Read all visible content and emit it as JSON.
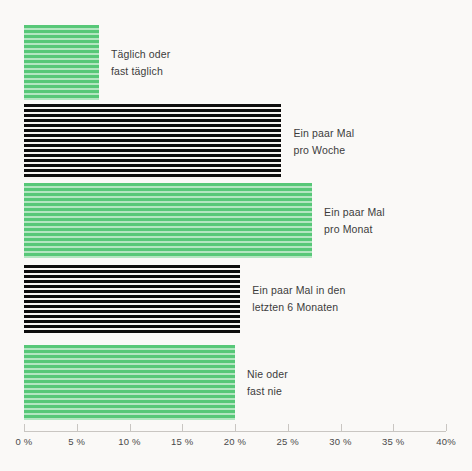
{
  "chart_data": {
    "type": "bar",
    "orientation": "horizontal",
    "title": "",
    "subtitle": "",
    "xlabel": "",
    "ylabel": "",
    "xlim": [
      0,
      40
    ],
    "grid": false,
    "legend": "none",
    "value_suffix": "%",
    "categories": [
      "Täglich oder fast täglich",
      "Ein paar Mal pro Woche",
      "Ein paar Mal pro Monat",
      "Ein paar Mal in den letzten 6 Monaten",
      "Nie oder fast nie"
    ],
    "values": [
      7.1,
      24.4,
      27.3,
      20.5,
      20.0
    ],
    "tick_labels": [
      "0 %",
      "5 %",
      "10 %",
      "15 %",
      "20 %",
      "25 %",
      "30 %",
      "35 %",
      "40%"
    ],
    "tick_values": [
      0,
      5,
      10,
      15,
      20,
      25,
      30,
      35,
      40
    ],
    "bars": [
      {
        "label_line1": "Täglich oder",
        "label_line2": "fast täglich",
        "value": 7.1,
        "color": "#57c878",
        "style": "green-striped"
      },
      {
        "label_line1": "Ein paar Mal",
        "label_line2": "pro Woche",
        "value": 24.4,
        "color": "#0d0d0d",
        "style": "black-striped"
      },
      {
        "label_line1": "Ein paar Mal",
        "label_line2": "pro Monat",
        "value": 27.3,
        "color": "#57c878",
        "style": "green-striped"
      },
      {
        "label_line1": "Ein paar Mal in den",
        "label_line2": "letzten 6 Monaten",
        "value": 20.5,
        "color": "#0d0d0d",
        "style": "black-striped"
      },
      {
        "label_line1": "Nie oder",
        "label_line2": "fast nie",
        "value": 20.0,
        "color": "#57c878",
        "style": "green-striped"
      }
    ]
  },
  "colors": {
    "background": "#faf9f7",
    "green": "#57c878",
    "green_light": "#b3e6c1",
    "black": "#0d0d0d",
    "axis": "#c9c6c2",
    "text": "#3c3c3c"
  }
}
